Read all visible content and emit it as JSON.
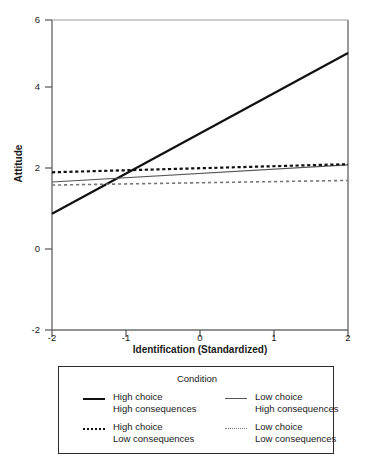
{
  "chart_data": {
    "type": "line",
    "title": "",
    "xlabel": "Identification (Standardized)",
    "ylabel": "Attitude",
    "xlim": [
      -2,
      2
    ],
    "ylim": [
      -2,
      6
    ],
    "xticks": [
      "-2",
      "-1",
      "0",
      "1",
      "2"
    ],
    "yticks": [
      "6",
      "4",
      "2",
      "0",
      "-2"
    ],
    "grid": false,
    "legend_position": "below-axes",
    "legend_title": "Condition",
    "x": [
      -2,
      2
    ],
    "series": [
      {
        "name": "High choice High consequences",
        "style": "solid-thick",
        "color": "#111111",
        "values": [
          1.0,
          5.15
        ]
      },
      {
        "name": "Low choice High consequences",
        "style": "solid-thin",
        "color": "#555555",
        "values": [
          1.82,
          2.26
        ]
      },
      {
        "name": "High choice Low consequences",
        "style": "dashed-thick",
        "color": "#111111",
        "values": [
          2.07,
          2.28
        ]
      },
      {
        "name": "Low choice Low consequences",
        "style": "dashed-thin",
        "color": "#777777",
        "values": [
          1.74,
          1.86
        ]
      }
    ]
  },
  "axes": {
    "ylabel": "Attitude",
    "xlabel": "Identification (Standardized)",
    "ytick_labels": [
      "6",
      "4",
      "2",
      "0",
      "-2"
    ],
    "xtick_labels": [
      "-2",
      "-1",
      "0",
      "1",
      "2"
    ]
  },
  "legend": {
    "title": "Condition",
    "entries": [
      {
        "line1": "High choice",
        "line2": "High consequences",
        "swatch": "solid-thick-line-icon"
      },
      {
        "line1": "Low choice",
        "line2": "High consequences",
        "swatch": "solid-thin-line-icon"
      },
      {
        "line1": "High choice",
        "line2": "Low consequences",
        "swatch": "dashed-thick-line-icon"
      },
      {
        "line1": "Low choice",
        "line2": "Low consequences",
        "swatch": "dashed-thin-line-icon"
      }
    ]
  }
}
